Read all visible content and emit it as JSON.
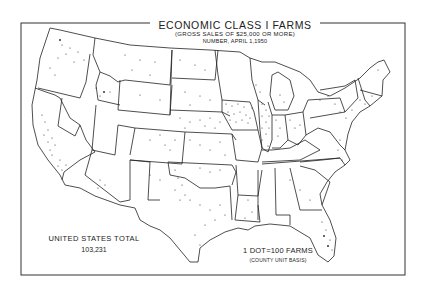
{
  "map": {
    "title": "ECONOMIC CLASS I FARMS",
    "subtitle": "(GROSS SALES OF $25,000 OR MORE)",
    "date_line": "NUMBER, APRIL 1,1950",
    "total_label": "UNITED STATES TOTAL",
    "total_value": "103,231",
    "legend_label": "1 DOT=100 FARMS",
    "legend_note": "(COUNTY UNIT BASIS)",
    "region": "Contiguous United States",
    "symbology": "dot density",
    "colors": {
      "background": "#ffffff",
      "ink": "#222222"
    }
  }
}
